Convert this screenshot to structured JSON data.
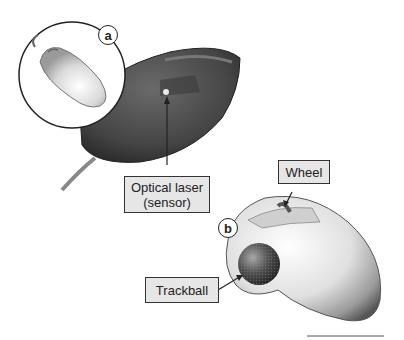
{
  "figure": {
    "panels": [
      {
        "id": "a",
        "badge": "a",
        "description": "Optical mouse, top view inset and underside view"
      },
      {
        "id": "b",
        "badge": "b",
        "description": "Trackball mouse"
      }
    ],
    "labels": {
      "optical_laser_line1": "Optical laser",
      "optical_laser_line2": "(sensor)",
      "wheel": "Wheel",
      "trackball": "Trackball"
    },
    "colors": {
      "label_fill": "#e6e6e6",
      "label_border": "#333333",
      "mouse_dark": "#4a4a4a",
      "mouse_light": "#d8d8d8"
    }
  }
}
